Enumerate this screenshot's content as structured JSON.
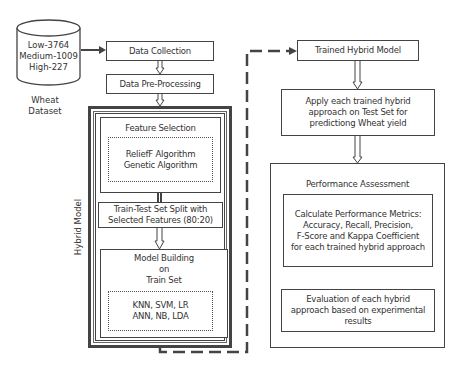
{
  "dataset": {
    "lines": [
      "Low-3764",
      "Medium-1009",
      "High-227"
    ],
    "caption_line1": "Wheat",
    "caption_line2": "Dataset"
  },
  "left_flow": {
    "data_collection": "Data Collection",
    "pre_processing": "Data Pre-Processing",
    "hybrid_model_label": "Hybrid Model",
    "feature_selection": {
      "title": "Feature Selection",
      "algorithms": [
        "ReliefF Algorithm",
        "Genetic Algorithm"
      ]
    },
    "train_test_split": {
      "line1": "Train-Test Set Split with",
      "line2": "Selected Features (80:20)"
    },
    "model_building": {
      "title_lines": [
        "Model Building",
        "on",
        "Train Set"
      ],
      "classifiers": [
        "KNN, SVM, LR",
        "ANN, NB, LDA"
      ]
    }
  },
  "right_flow": {
    "trained_model": "Trained Hybrid Model",
    "apply": {
      "lines": [
        "Apply each trained hybrid",
        "approach on Test Set for",
        "predictiong Wheat yield"
      ]
    },
    "performance": {
      "title": "Performance Assessment",
      "metrics_lines": [
        "Calculate Performance Metrics:",
        "Accuracy, Recall, Precision,",
        "F-Score and Kappa Coefficient",
        "for each trained hybrid approach"
      ],
      "evaluation_lines": [
        "Evaluation of each hybrid",
        "approach based on experimental",
        "results"
      ]
    }
  },
  "colors": {
    "stroke": "#444444",
    "text": "#333333",
    "background": "#ffffff"
  }
}
